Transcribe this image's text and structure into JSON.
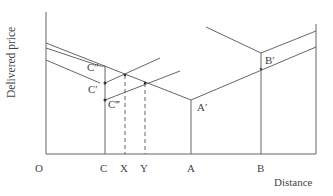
{
  "diagram": {
    "type": "delivered-price-vs-distance",
    "axis_labels": {
      "y": "Delivered price",
      "x": "Distance"
    },
    "x_ticks": [
      "O",
      "C",
      "X",
      "Y",
      "A",
      "B"
    ],
    "point_labels": {
      "c_double_prime": "C″",
      "c_prime": "C′",
      "c_triple_prime": "C‴",
      "a_prime": "A′",
      "b_prime": "B′"
    },
    "line_color": "#555555"
  }
}
